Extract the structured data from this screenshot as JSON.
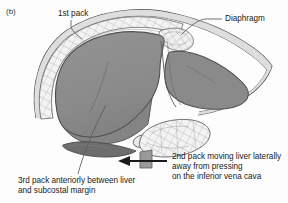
{
  "figure": {
    "panel_letter": "(b)",
    "background_color": "#fdfdfd"
  },
  "labels": {
    "first_pack": "1st pack",
    "diaphragm": "Diaphragm",
    "second_pack": "2nd pack moving liver laterally\naway from pressing\non the inferior vena cava",
    "third_pack": "3rd pack anteriorly between liver\nand subcostal margin"
  },
  "colors": {
    "liver_fill": "#8d8d8d",
    "liver_fill_dark": "#7a7a7a",
    "third_pack_fill": "#6e6e6e",
    "pack_fill": "#f2f2f2",
    "pack_hatch": "#9a9a9a",
    "diaphragm_fill": "#d9d9d9",
    "outline": "#4a4a4a",
    "text": "#1b1b1b",
    "leader_line": "#5a5a5a",
    "arrow": "#1b1b1b"
  },
  "annotations": {
    "arrow_direction": "left",
    "arrow_label_target": "second_pack"
  }
}
